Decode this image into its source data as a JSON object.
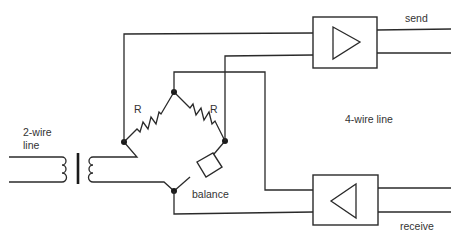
{
  "diagram": {
    "labels": {
      "two_wire_line": [
        "2-wire",
        "line"
      ],
      "four_wire_line": "4-wire line",
      "send": "send",
      "receive": "receive",
      "balance": "balance",
      "resistor_left": "R",
      "resistor_right": "R"
    },
    "components": [
      {
        "id": "transformer",
        "type": "transformer"
      },
      {
        "id": "r-left",
        "type": "resistor",
        "label": "R"
      },
      {
        "id": "r-right",
        "type": "resistor",
        "label": "R"
      },
      {
        "id": "balance",
        "type": "impedance",
        "label": "balance"
      },
      {
        "id": "send-amp",
        "type": "amplifier",
        "direction": "right",
        "label": "send"
      },
      {
        "id": "receive-amp",
        "type": "amplifier",
        "direction": "left",
        "label": "receive"
      }
    ],
    "colors": {
      "line": "#2a2a2a",
      "text": "#333333",
      "background": "#ffffff"
    }
  }
}
